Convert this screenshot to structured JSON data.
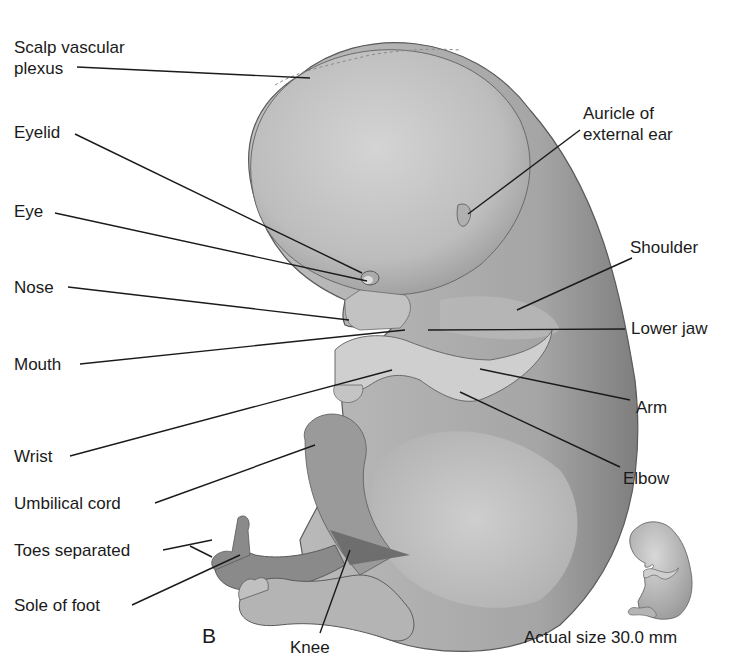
{
  "figure": {
    "panel_letter": "B",
    "caption": "Actual size 30.0 mm",
    "labels_left": [
      {
        "id": "scalp",
        "line1": "Scalp vascular",
        "line2": "plexus"
      },
      {
        "id": "eyelid",
        "text": "Eyelid"
      },
      {
        "id": "eye",
        "text": "Eye"
      },
      {
        "id": "nose",
        "text": "Nose"
      },
      {
        "id": "mouth",
        "text": "Mouth"
      },
      {
        "id": "wrist",
        "text": "Wrist"
      },
      {
        "id": "umbilical",
        "text": "Umbilical cord"
      },
      {
        "id": "toes",
        "text": "Toes separated"
      },
      {
        "id": "sole",
        "text": "Sole of foot"
      }
    ],
    "labels_right": [
      {
        "id": "auricle",
        "line1": "Auricle of",
        "line2": "external ear"
      },
      {
        "id": "shoulder",
        "text": "Shoulder"
      },
      {
        "id": "lowerjaw",
        "text": "Lower jaw"
      },
      {
        "id": "arm",
        "text": "Arm"
      },
      {
        "id": "elbow",
        "text": "Elbow"
      }
    ],
    "labels_bottom": [
      {
        "id": "knee",
        "text": "Knee"
      }
    ],
    "colors": {
      "skin_light": "#c9c9c9",
      "skin_mid": "#a9a9a9",
      "skin_dark": "#7a7a7a",
      "outline": "#5a5a5a",
      "leader": "#1a1a1a"
    }
  }
}
